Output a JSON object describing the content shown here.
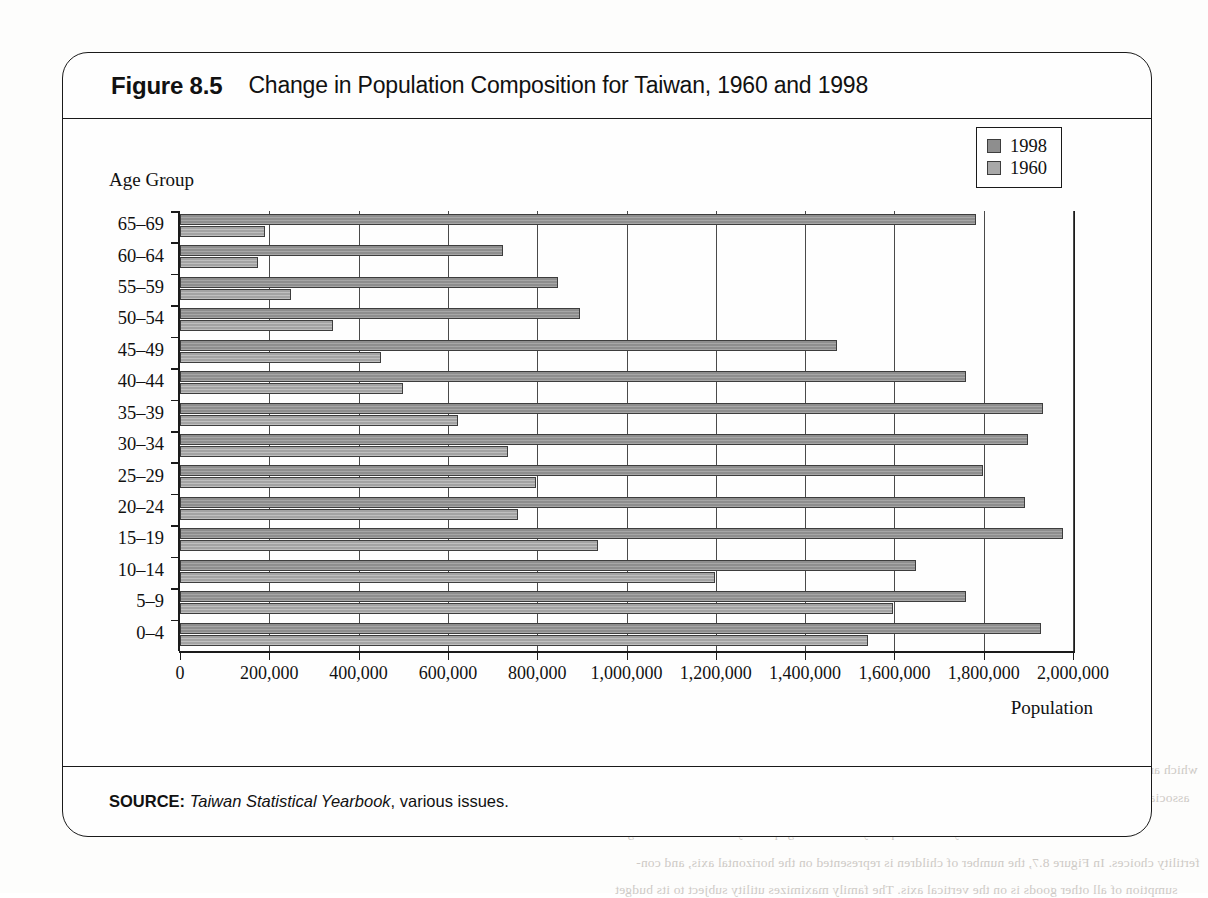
{
  "figure": {
    "label": "Figure 8.5",
    "title": "Change in Population Composition for Taiwan, 1960 and 1998",
    "source_label": "SOURCE:",
    "source_work": "Taiwan Statistical Yearbook",
    "source_rest": ", various issues."
  },
  "legend": {
    "position": "top-right",
    "entries": [
      {
        "name": "1998",
        "color": "#8e8e8e"
      },
      {
        "name": "1960",
        "color": "#a8a8a8"
      }
    ]
  },
  "scan_showthrough": {
    "top_right": "Figure 8.6   Suppl",
    "mid": "Demand",
    "line1": "which are less than the originally desired number of d*. This cross-national approach to family choices is",
    "line2": "associated with Gary Becker (1991).",
    "line3": "The economic model of fertility and child quality can be used graphically to illustrate the range of",
    "line4": "fertility choices. In Figure 8.7, the number of children is represented on the horizontal axis, and con-",
    "line5": "sumption of all other goods is on the vertical axis. The family maximizes utility subject to its budget"
  },
  "chart_data": {
    "type": "bar",
    "orientation": "horizontal",
    "title": "Change in Population Composition for Taiwan, 1960 and 1998",
    "xlabel": "Population",
    "ylabel": "Age Group",
    "xlim": [
      0,
      2000000
    ],
    "xticks": [
      0,
      200000,
      400000,
      600000,
      800000,
      1000000,
      1200000,
      1400000,
      1600000,
      1800000,
      2000000
    ],
    "xticklabels": [
      "0",
      "200,000",
      "400,000",
      "600,000",
      "800,000",
      "1,000,000",
      "1,200,000",
      "1,400,000",
      "1,600,000",
      "1,800,000",
      "2,000,000"
    ],
    "grid": "vertical",
    "legend_position": "upper right",
    "categories": [
      "65–69",
      "60–64",
      "55–59",
      "50–54",
      "45–49",
      "40–44",
      "35–39",
      "30–34",
      "25–29",
      "20–24",
      "15–19",
      "10–14",
      "5–9",
      "0–4"
    ],
    "series": [
      {
        "name": "1998",
        "color": "#8e8e8e",
        "values": [
          1783000,
          723000,
          846000,
          896000,
          1471000,
          1760000,
          1933000,
          1900000,
          1798000,
          1893000,
          1978000,
          1648000,
          1760000,
          1928000
        ]
      },
      {
        "name": "1960",
        "color": "#a8a8a8",
        "values": [
          190000,
          175000,
          248000,
          343000,
          450000,
          500000,
          623000,
          735000,
          798000,
          757000,
          937000,
          1198000,
          1597000,
          1540000
        ]
      }
    ]
  }
}
